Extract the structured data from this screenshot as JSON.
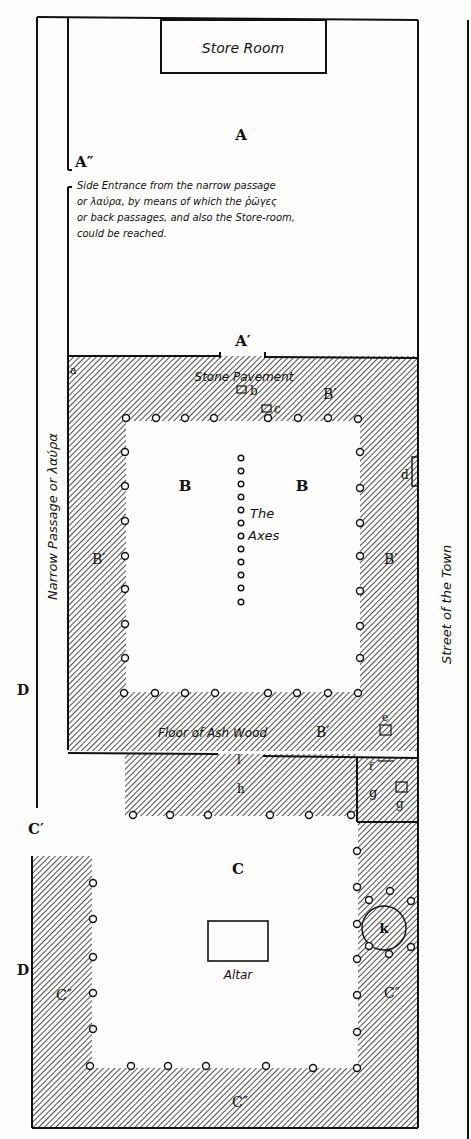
{
  "diagram": {
    "labels": {
      "store_room": "Store Room",
      "A": "A",
      "A_double": "A″",
      "A_prime": "A′",
      "side_entrance_note": [
        "Side Entrance from the narrow passage",
        "or λαύρα, by means of which the ῥῶγες",
        "or back passages, and also the Store-room,",
        "could be reached."
      ],
      "stone_pavement": "Stone Pavement",
      "a": "a",
      "b": "b",
      "c": "c",
      "d": "d",
      "e": "e",
      "f": "f",
      "g1": "g",
      "g2": "g",
      "h": "h",
      "k": "k",
      "l": "l",
      "B_left": "B",
      "B_right": "B",
      "B_prime_top": "B′",
      "B_prime_left": "B′",
      "B_prime_right": "B′",
      "B_prime_bottom": "B′",
      "the_axes": [
        "The",
        "Axes"
      ],
      "floor_ash": "Floor of Ash Wood",
      "narrow_passage": "Narrow Passage or λαύρα",
      "street": "Street of the Town",
      "D_upper": "D",
      "D_lower": "D",
      "C": "C",
      "C_prime": "C′",
      "C_double_left": "C″",
      "C_double_right": "C″",
      "C_double_bottom": "C″",
      "altar": "Altar"
    },
    "colors": {
      "ink": "#111111",
      "paper": "#fdfdfb"
    }
  }
}
